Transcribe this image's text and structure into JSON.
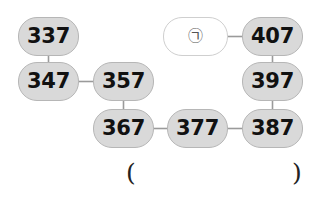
{
  "diagram": {
    "colors": {
      "node_fill": "#d9d9d9",
      "node_border": "#b6b6b6",
      "blank_fill": "#ffffff",
      "blank_border": "#cfcfcf",
      "link_stroke": "#9a9a9a",
      "text": "#111111",
      "background": "#ffffff"
    },
    "nodes": [
      {
        "id": "n337",
        "label": "337",
        "kind": "number",
        "x": 18,
        "y": 17,
        "w": 61,
        "h": 39
      },
      {
        "id": "nblank",
        "label": "㉠",
        "kind": "blank",
        "x": 163,
        "y": 17,
        "w": 65,
        "h": 39
      },
      {
        "id": "n407",
        "label": "407",
        "kind": "number",
        "x": 242,
        "y": 17,
        "w": 61,
        "h": 39
      },
      {
        "id": "n347",
        "label": "347",
        "kind": "number",
        "x": 18,
        "y": 62,
        "w": 61,
        "h": 39
      },
      {
        "id": "n357",
        "label": "357",
        "kind": "number",
        "x": 93,
        "y": 62,
        "w": 61,
        "h": 39
      },
      {
        "id": "n397",
        "label": "397",
        "kind": "number",
        "x": 242,
        "y": 62,
        "w": 61,
        "h": 39
      },
      {
        "id": "n367",
        "label": "367",
        "kind": "number",
        "x": 93,
        "y": 109,
        "w": 61,
        "h": 39
      },
      {
        "id": "n377",
        "label": "377",
        "kind": "number",
        "x": 167,
        "y": 109,
        "w": 61,
        "h": 39
      },
      {
        "id": "n387",
        "label": "387",
        "kind": "number",
        "x": 242,
        "y": 109,
        "w": 61,
        "h": 39
      }
    ],
    "links": [
      {
        "from": "n337",
        "to": "n347",
        "x1": 48.5,
        "y1": 56,
        "x2": 48.5,
        "y2": 62
      },
      {
        "from": "n347",
        "to": "n357",
        "x1": 79,
        "y1": 81.5,
        "x2": 93,
        "y2": 81.5
      },
      {
        "from": "n357",
        "to": "n367",
        "x1": 123.5,
        "y1": 101,
        "x2": 123.5,
        "y2": 109
      },
      {
        "from": "n367",
        "to": "n377",
        "x1": 154,
        "y1": 128.5,
        "x2": 167,
        "y2": 128.5
      },
      {
        "from": "n377",
        "to": "n387",
        "x1": 228,
        "y1": 128.5,
        "x2": 242,
        "y2": 128.5
      },
      {
        "from": "n387",
        "to": "n397",
        "x1": 272.5,
        "y1": 109,
        "x2": 272.5,
        "y2": 101
      },
      {
        "from": "n397",
        "to": "n407",
        "x1": 272.5,
        "y1": 62,
        "x2": 272.5,
        "y2": 56
      },
      {
        "from": "n407",
        "to": "nblank",
        "x1": 242,
        "y1": 36.5,
        "x2": 228,
        "y2": 36.5
      }
    ],
    "annotations": [
      {
        "id": "paren-open",
        "label": "(",
        "x": 126,
        "y": 160
      },
      {
        "id": "paren-close",
        "label": ")",
        "x": 292,
        "y": 160
      }
    ]
  }
}
